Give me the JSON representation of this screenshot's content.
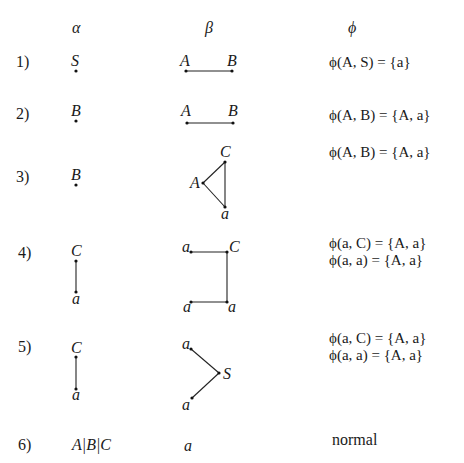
{
  "headers": {
    "alpha": "α",
    "beta": "β",
    "phi": "ϕ"
  },
  "rows": [
    {
      "index": "1)",
      "alpha": {
        "nodes": [
          "S"
        ]
      },
      "beta": {
        "nodes": [
          "A",
          "B"
        ],
        "edges": [
          [
            "A",
            "B"
          ]
        ]
      },
      "phi": [
        "ϕ(A, S) = {a}"
      ]
    },
    {
      "index": "2)",
      "alpha": {
        "nodes": [
          "B"
        ]
      },
      "beta": {
        "nodes": [
          "A",
          "B"
        ],
        "edges": [
          [
            "A",
            "B"
          ]
        ]
      },
      "phi": [
        "ϕ(A, B) = {A, a}"
      ]
    },
    {
      "index": "3)",
      "alpha": {
        "nodes": [
          "B"
        ]
      },
      "beta": {
        "nodes": [
          "C",
          "A",
          "a"
        ],
        "edges": [
          [
            "A",
            "C"
          ],
          [
            "C",
            "a"
          ],
          [
            "A",
            "a"
          ]
        ]
      },
      "phi": [
        "ϕ(A, B) = {A, a}"
      ]
    },
    {
      "index": "4)",
      "alpha": {
        "nodes": [
          "C",
          "a"
        ],
        "edges": [
          [
            "C",
            "a"
          ]
        ]
      },
      "beta": {
        "nodes": [
          "a",
          "C",
          "a",
          "a"
        ],
        "edges": [
          [
            "a",
            "C"
          ],
          [
            "C",
            "a"
          ],
          [
            "a",
            "a"
          ]
        ]
      },
      "phi": [
        "ϕ(a, C) = {A, a}",
        "ϕ(a, a) = {A, a}"
      ]
    },
    {
      "index": "5)",
      "alpha": {
        "nodes": [
          "C",
          "a"
        ],
        "edges": [
          [
            "C",
            "a"
          ]
        ]
      },
      "beta": {
        "nodes": [
          "a",
          "S",
          "a"
        ],
        "edges": [
          [
            "a",
            "S"
          ],
          [
            "S",
            "a"
          ]
        ]
      },
      "phi": [
        "ϕ(a, C) = {A, a}",
        "ϕ(a, a) = {A, a}"
      ]
    },
    {
      "index": "6)",
      "alpha": {
        "text": "A|B|C"
      },
      "beta": {
        "text": "a"
      },
      "phi": [
        "normal"
      ]
    }
  ]
}
